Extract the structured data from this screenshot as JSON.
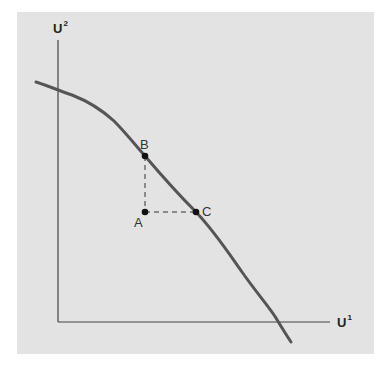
{
  "diagram": {
    "type": "utility-possibility-frontier",
    "y_axis": {
      "label": "U",
      "superscript": "2"
    },
    "x_axis": {
      "label": "U",
      "superscript": "1"
    },
    "points": [
      {
        "id": "A",
        "label": "A",
        "x": 145,
        "y": 212
      },
      {
        "id": "B",
        "label": "B",
        "x": 145,
        "y": 156
      },
      {
        "id": "C",
        "label": "C",
        "x": 196,
        "y": 212
      }
    ],
    "curve_color": "#555555",
    "axis_color": "#444444",
    "background_color": "#e3e3e3"
  }
}
